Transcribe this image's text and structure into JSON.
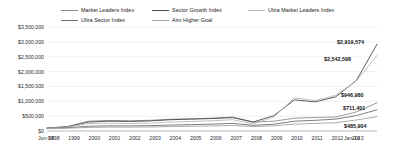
{
  "chart_data": {
    "type": "line",
    "title": "",
    "xlabel": "",
    "ylabel": "",
    "ylim": [
      0,
      3500000
    ],
    "ytick_labels": [
      "$3,500,000",
      "$3,000,000",
      "$2,500,000",
      "$2,000,000",
      "$1,500,000",
      "$1,000,000",
      "$500,000",
      "$0"
    ],
    "ytick_values": [
      3500000,
      3000000,
      2500000,
      2000000,
      1500000,
      1000000,
      500000,
      0
    ],
    "grid": true,
    "legend_position": "top",
    "x_start_label": "Jun-98",
    "x_end_label": "Jan-14",
    "xtick_labels": [
      "Jun-98",
      "1998",
      "1999",
      "2000",
      "2001",
      "2002",
      "2003",
      "2004",
      "2005",
      "2006",
      "2007",
      "2008",
      "2009",
      "2010",
      "2011",
      "2012",
      "2013",
      "Jan-14"
    ],
    "categories": [
      "1998",
      "1999",
      "2000",
      "2001",
      "2002",
      "2003",
      "2004",
      "2005",
      "2006",
      "2007",
      "2008",
      "2009",
      "2010",
      "2011",
      "2012",
      "2013",
      "2014"
    ],
    "series": [
      {
        "name": "Market Leaders Index",
        "color": "#8c8c8c",
        "end_value": 946980,
        "end_label": "$946,980",
        "values": [
          100000,
          150000,
          330000,
          355000,
          345000,
          360000,
          395000,
          410000,
          430000,
          470000,
          300000,
          330000,
          430000,
          455000,
          470000,
          640000,
          946980
        ]
      },
      {
        "name": "Sector Growth Index",
        "color": "#4a4a4a",
        "end_value": 2919574,
        "end_label": "$2,919,574",
        "values": [
          100000,
          140000,
          300000,
          330000,
          320000,
          340000,
          380000,
          400000,
          420000,
          450000,
          300000,
          520000,
          1050000,
          980000,
          1150000,
          1700000,
          2919574
        ]
      },
      {
        "name": "Ultra Market Leaders Index",
        "color": "#b9b9b9",
        "end_value": 2542598,
        "end_label": "$2,542,598",
        "values": [
          95000,
          130000,
          250000,
          260000,
          250000,
          265000,
          300000,
          320000,
          345000,
          380000,
          240000,
          470000,
          1120000,
          1020000,
          1200000,
          1680000,
          2542598
        ]
      },
      {
        "name": "Ultra Sector Index",
        "color": "#6d6d6d",
        "end_value": 711401,
        "end_label": "$711,401",
        "values": [
          90000,
          110000,
          160000,
          175000,
          170000,
          180000,
          200000,
          215000,
          230000,
          255000,
          190000,
          230000,
          330000,
          360000,
          400000,
          520000,
          711401
        ]
      },
      {
        "name": "Aim Higher Goal",
        "color": "#a3a3a3",
        "end_value": 485904,
        "end_label": "$485,904",
        "values": [
          80000,
          95000,
          120000,
          130000,
          130000,
          135000,
          150000,
          160000,
          170000,
          185000,
          150000,
          175000,
          230000,
          255000,
          280000,
          370000,
          485904
        ]
      }
    ]
  }
}
